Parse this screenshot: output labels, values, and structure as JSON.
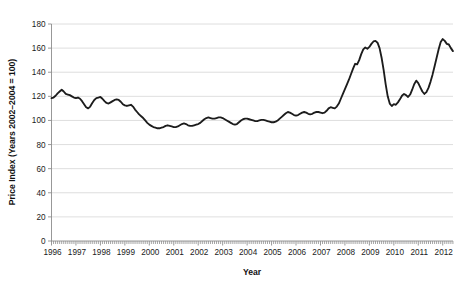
{
  "chart_data": {
    "type": "line",
    "title": "",
    "subtitle": "",
    "xlabel": "Year",
    "ylabel": "Price Index (Years 2002–2004 = 100)",
    "xlim": [
      1996.0,
      2012.42
    ],
    "ylim": [
      0,
      180
    ],
    "y_ticks": [
      0,
      20,
      40,
      60,
      80,
      100,
      120,
      140,
      160,
      180
    ],
    "y_tick_labels": [
      "0",
      "20",
      "40",
      "60",
      "80",
      "100",
      "120",
      "140",
      "160",
      "180"
    ],
    "x_ticks": [
      1996,
      1997,
      1998,
      1999,
      2000,
      2001,
      2002,
      2003,
      2004,
      2005,
      2006,
      2007,
      2008,
      2009,
      2010,
      2011,
      2012
    ],
    "x_tick_labels": [
      "1996",
      "1997",
      "1998",
      "1999",
      "2000",
      "2001",
      "2002",
      "2003",
      "2004",
      "2005",
      "2006",
      "2007",
      "2008",
      "2009",
      "2010",
      "2011",
      "2012"
    ],
    "grid": "horizontal",
    "legend": "none",
    "line_color": "#1c1c1c",
    "grid_color": "#d6d6d6",
    "axis_color": "#8c8c8c",
    "minor_ticks_axis": "x",
    "minor_tick_interval_months": 1,
    "series": [
      {
        "name": "Price Index",
        "x": [
          1996.0,
          1996.083,
          1996.167,
          1996.25,
          1996.333,
          1996.417,
          1996.5,
          1996.583,
          1996.667,
          1996.75,
          1996.833,
          1996.917,
          1997.0,
          1997.083,
          1997.167,
          1997.25,
          1997.333,
          1997.417,
          1997.5,
          1997.583,
          1997.667,
          1997.75,
          1997.833,
          1997.917,
          1998.0,
          1998.083,
          1998.167,
          1998.25,
          1998.333,
          1998.417,
          1998.5,
          1998.583,
          1998.667,
          1998.75,
          1998.833,
          1998.917,
          1999.0,
          1999.083,
          1999.167,
          1999.25,
          1999.333,
          1999.417,
          1999.5,
          1999.583,
          1999.667,
          1999.75,
          1999.833,
          1999.917,
          2000.0,
          2000.083,
          2000.167,
          2000.25,
          2000.333,
          2000.417,
          2000.5,
          2000.583,
          2000.667,
          2000.75,
          2000.833,
          2000.917,
          2001.0,
          2001.083,
          2001.167,
          2001.25,
          2001.333,
          2001.417,
          2001.5,
          2001.583,
          2001.667,
          2001.75,
          2001.833,
          2001.917,
          2002.0,
          2002.083,
          2002.167,
          2002.25,
          2002.333,
          2002.417,
          2002.5,
          2002.583,
          2002.667,
          2002.75,
          2002.833,
          2002.917,
          2003.0,
          2003.083,
          2003.167,
          2003.25,
          2003.333,
          2003.417,
          2003.5,
          2003.583,
          2003.667,
          2003.75,
          2003.833,
          2003.917,
          2004.0,
          2004.083,
          2004.167,
          2004.25,
          2004.333,
          2004.417,
          2004.5,
          2004.583,
          2004.667,
          2004.75,
          2004.833,
          2004.917,
          2005.0,
          2005.083,
          2005.167,
          2005.25,
          2005.333,
          2005.417,
          2005.5,
          2005.583,
          2005.667,
          2005.75,
          2005.833,
          2005.917,
          2006.0,
          2006.083,
          2006.167,
          2006.25,
          2006.333,
          2006.417,
          2006.5,
          2006.583,
          2006.667,
          2006.75,
          2006.833,
          2006.917,
          2007.0,
          2007.083,
          2007.167,
          2007.25,
          2007.333,
          2007.417,
          2007.5,
          2007.583,
          2007.667,
          2007.75,
          2007.833,
          2007.917,
          2008.0,
          2008.083,
          2008.167,
          2008.25,
          2008.333,
          2008.417,
          2008.5,
          2008.583,
          2008.667,
          2008.75,
          2008.833,
          2008.917,
          2009.0,
          2009.083,
          2009.167,
          2009.25,
          2009.333,
          2009.417,
          2009.5,
          2009.583,
          2009.667,
          2009.75,
          2009.833,
          2009.917,
          2010.0,
          2010.083,
          2010.167,
          2010.25,
          2010.333,
          2010.417,
          2010.5,
          2010.583,
          2010.667,
          2010.75,
          2010.833,
          2010.917,
          2011.0,
          2011.083,
          2011.167,
          2011.25,
          2011.333,
          2011.417,
          2011.5,
          2011.583,
          2011.667,
          2011.75,
          2011.833,
          2011.917,
          2012.0,
          2012.083,
          2012.167,
          2012.25,
          2012.333,
          2012.417
        ],
        "values": [
          118.5,
          119.0,
          120.5,
          122.5,
          124.0,
          125.5,
          124.0,
          122.0,
          121.5,
          121.0,
          120.0,
          119.0,
          118.5,
          119.0,
          118.0,
          116.0,
          113.5,
          111.0,
          110.0,
          111.5,
          114.5,
          117.0,
          118.5,
          119.0,
          119.5,
          118.0,
          116.0,
          114.5,
          114.0,
          115.0,
          116.0,
          117.0,
          117.5,
          117.0,
          115.5,
          113.5,
          112.5,
          112.0,
          112.5,
          113.0,
          111.5,
          109.0,
          107.0,
          105.0,
          103.5,
          102.0,
          100.0,
          98.0,
          96.5,
          95.5,
          94.5,
          94.0,
          93.5,
          93.5,
          94.0,
          94.5,
          95.5,
          96.0,
          95.5,
          95.0,
          94.5,
          94.5,
          95.0,
          96.0,
          97.0,
          97.5,
          97.0,
          96.0,
          95.5,
          95.5,
          96.0,
          96.5,
          97.0,
          98.0,
          99.5,
          101.0,
          102.0,
          102.5,
          102.0,
          101.5,
          101.5,
          102.0,
          102.5,
          102.5,
          102.0,
          101.0,
          100.0,
          99.0,
          98.0,
          97.0,
          96.5,
          97.0,
          98.5,
          100.0,
          101.0,
          101.5,
          101.5,
          101.0,
          100.5,
          100.0,
          99.5,
          99.5,
          100.0,
          100.5,
          100.5,
          100.0,
          99.5,
          99.0,
          98.5,
          98.5,
          99.0,
          100.0,
          101.5,
          103.0,
          104.5,
          106.0,
          107.0,
          106.5,
          105.5,
          104.5,
          104.0,
          104.5,
          105.5,
          106.5,
          107.0,
          106.5,
          105.5,
          105.0,
          105.5,
          106.5,
          107.0,
          107.0,
          106.5,
          106.0,
          106.5,
          108.0,
          110.0,
          111.0,
          110.5,
          110.0,
          111.5,
          114.0,
          118.0,
          122.0,
          126.0,
          130.0,
          134.0,
          138.5,
          143.0,
          147.0,
          146.5,
          150.0,
          155.0,
          159.0,
          160.5,
          159.5,
          161.0,
          163.5,
          165.5,
          166.0,
          164.5,
          160.0,
          152.0,
          142.0,
          130.0,
          120.0,
          114.0,
          112.0,
          113.5,
          113.0,
          115.0,
          117.5,
          120.5,
          122.0,
          121.0,
          119.5,
          121.5,
          125.5,
          130.0,
          133.0,
          131.0,
          127.5,
          124.0,
          122.0,
          123.5,
          127.0,
          132.0,
          138.0,
          145.0,
          152.0,
          159.0,
          165.0,
          167.5,
          166.0,
          163.5,
          163.0,
          160.0,
          157.5
        ]
      }
    ],
    "notes": {
      "peak_2008": 166,
      "peak_2011": 167.5,
      "trough_2000": 93.5,
      "start_value": 118.5,
      "end_value": 140
    }
  },
  "axis_titles": {
    "x": "Year",
    "y": "Price Index (Years 2002–2004 = 100)"
  }
}
